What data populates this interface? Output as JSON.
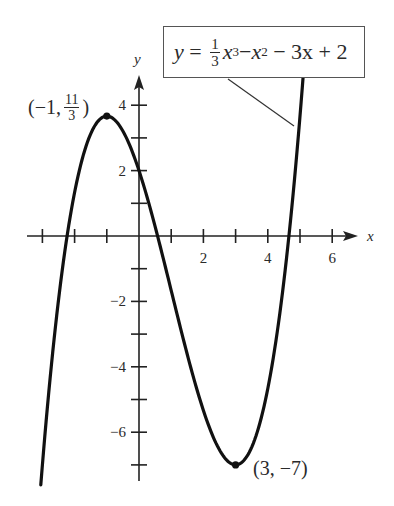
{
  "chart_data": {
    "type": "line",
    "title": "",
    "function": "y = (1/3)x^3 - x^2 - 3x + 2",
    "equation_label": {
      "lhs": "y",
      "frac_num": "1",
      "frac_den": "3",
      "term1": "x",
      "term1_exp": "3",
      "minus1": "−",
      "term2": "x",
      "term2_exp": "2",
      "rest": "− 3x + 2"
    },
    "xlabel": "x",
    "ylabel": "y",
    "xlim": [
      -3.5,
      7
    ],
    "ylim": [
      -7.5,
      5
    ],
    "x_ticks": [
      -3,
      -2,
      -1,
      0,
      1,
      2,
      3,
      4,
      5,
      6
    ],
    "x_tick_labels": [
      "2",
      "4",
      "6"
    ],
    "x_tick_label_values": [
      2,
      4,
      6
    ],
    "y_ticks": [
      -7,
      -6,
      -5,
      -4,
      -3,
      -2,
      -1,
      1,
      2,
      3,
      4
    ],
    "y_tick_labels": [
      "4",
      "2",
      "−2",
      "−4",
      "−6"
    ],
    "y_tick_label_values": [
      4,
      2,
      -2,
      -4,
      -6
    ],
    "grid": false,
    "legend": null,
    "series": [
      {
        "name": "y = (1/3)x^3 - x^2 - 3x + 2",
        "x": [
          -3.05,
          -2.5,
          -2,
          -1.5,
          -1,
          -0.5,
          0,
          0.5,
          1,
          1.5,
          2,
          2.5,
          3,
          3.5,
          4,
          4.5,
          5,
          5.2
        ],
        "y": [
          -7.51,
          -2.96,
          0.33,
          2.63,
          3.67,
          3.21,
          2,
          -0.21,
          -1.67,
          -3.88,
          -5.33,
          -6.46,
          -7,
          -6.71,
          -5.33,
          -2.63,
          1.67,
          3.67
        ]
      }
    ],
    "annotations": [
      {
        "point": [
          -1,
          3.6667
        ],
        "label_prefix": "(−1,",
        "label_frac_num": "11",
        "label_frac_den": "3",
        "label_suffix": ")",
        "type": "local maximum"
      },
      {
        "point": [
          3,
          -7
        ],
        "label": "(3, −7)",
        "type": "local minimum"
      }
    ]
  }
}
